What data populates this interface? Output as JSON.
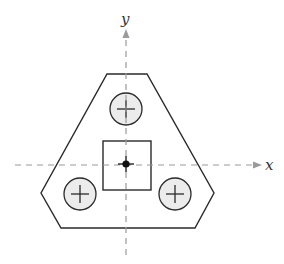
{
  "diagram": {
    "type": "engineering-cross-section",
    "axes": {
      "x_label": "x",
      "y_label": "y",
      "origin": [
        126,
        164
      ],
      "line_color": "#9a9a9a",
      "style": "dashed"
    },
    "plate": {
      "shape": "truncated-triangle (hexagon)",
      "vertices": [
        [
          107,
          74
        ],
        [
          147,
          74
        ],
        [
          214,
          193
        ],
        [
          195,
          228
        ],
        [
          61,
          228
        ],
        [
          41,
          193
        ]
      ],
      "stroke": "#2a2a2a",
      "fill": "#ffffff"
    },
    "holes": [
      {
        "name": "top",
        "center": [
          126,
          109
        ],
        "radius": 16,
        "fill": "#ececec",
        "marker": "+"
      },
      {
        "name": "bottom-left",
        "center": [
          80,
          194
        ],
        "radius": 16,
        "fill": "#ececec",
        "marker": "+"
      },
      {
        "name": "bottom-right",
        "center": [
          175,
          194
        ],
        "radius": 16,
        "fill": "#ececec",
        "marker": "+"
      }
    ],
    "center_square": {
      "x": 103,
      "y": 141,
      "width": 48,
      "height": 49,
      "stroke": "#2a2a2a"
    },
    "centroid": {
      "position": [
        126,
        164
      ],
      "marker": "filled dot with cross"
    }
  }
}
